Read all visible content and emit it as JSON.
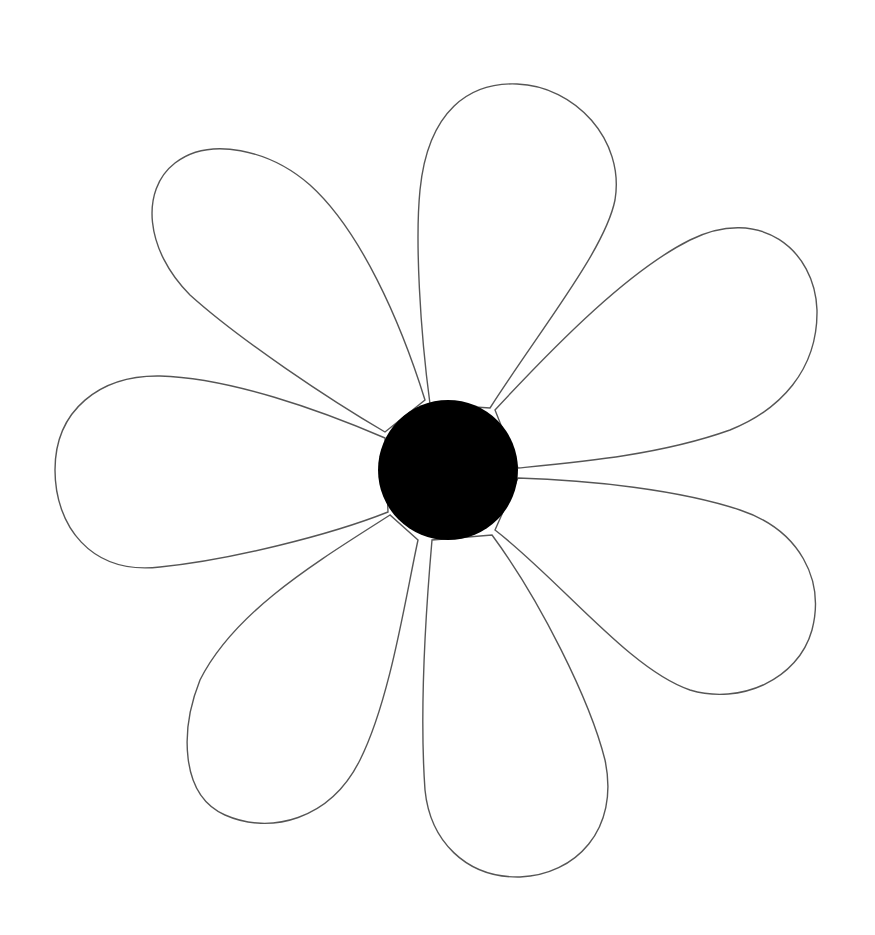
{
  "image": {
    "subject": "flower line drawing",
    "background_color": "#ffffff",
    "outline_color": "#555555",
    "center_color": "#000000",
    "petal_count": 7,
    "center": {
      "cx": 448,
      "cy": 470,
      "r": 70
    }
  },
  "petals": [
    {
      "name": "petal-top",
      "tip": [
        517,
        82
      ]
    },
    {
      "name": "petal-upper-right",
      "tip": [
        815,
        318
      ]
    },
    {
      "name": "petal-lower-right",
      "tip": [
        815,
        610
      ]
    },
    {
      "name": "petal-bottom",
      "tip": [
        520,
        877
      ]
    },
    {
      "name": "petal-lower-left",
      "tip": [
        190,
        780
      ]
    },
    {
      "name": "petal-left",
      "tip": [
        55,
        470
      ]
    },
    {
      "name": "petal-upper-left",
      "tip": [
        215,
        150
      ]
    }
  ]
}
